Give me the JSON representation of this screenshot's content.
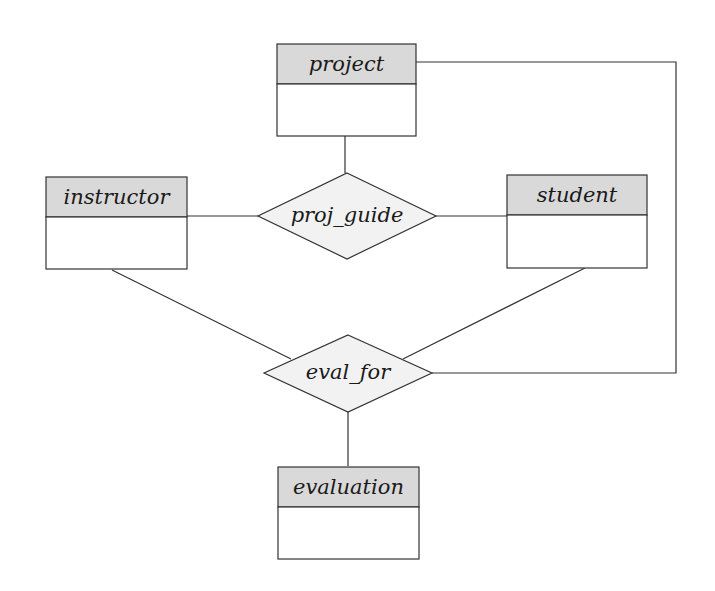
{
  "diagram": {
    "type": "ER diagram",
    "entities": [
      {
        "id": "project",
        "label": "project"
      },
      {
        "id": "instructor",
        "label": "instructor"
      },
      {
        "id": "student",
        "label": "student"
      },
      {
        "id": "evaluation",
        "label": "evaluation"
      }
    ],
    "relationships": [
      {
        "id": "proj_guide",
        "label": "proj_guide",
        "connects": [
          "project",
          "instructor",
          "student"
        ]
      },
      {
        "id": "eval_for",
        "label": "eval_for",
        "connects": [
          "instructor",
          "student",
          "project",
          "evaluation"
        ]
      }
    ]
  }
}
